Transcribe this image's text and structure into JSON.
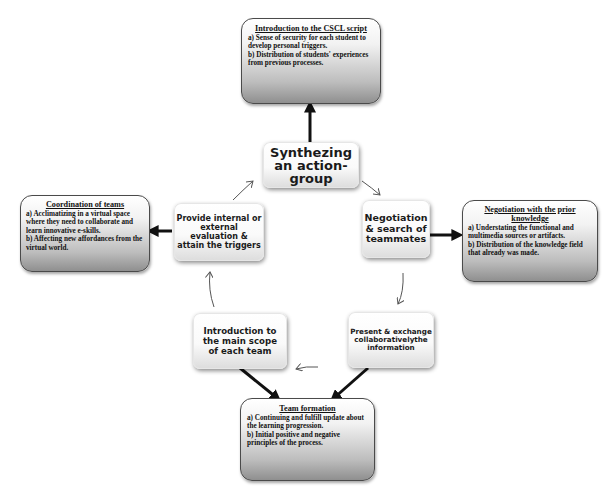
{
  "diagram": {
    "center_steps": [
      {
        "id": "synthezing",
        "label": "Synthezing an action-group"
      },
      {
        "id": "negotiation_search",
        "label": "Negotiation & search of teammates"
      },
      {
        "id": "present_exchange",
        "label": "Present & exchange collaborativelythe information"
      },
      {
        "id": "introduction_scope",
        "label": "Introduction to the main scope of each team"
      },
      {
        "id": "provide_evaluation",
        "label": "Provide internal or external evaluation & attain the triggers"
      }
    ],
    "detail_boxes": {
      "intro_cscl": {
        "title": "Introduction to the CSCL script",
        "lines": [
          "a) Sense of security for each student to develop personal triggers.",
          "b) Distribution of students' experiences from previous processes."
        ]
      },
      "negotiation_prior": {
        "title": "Negotiation with the prior knowledge",
        "lines": [
          "a) Understating the functional and multimedia sources or artifacts.",
          "b) Distribution of the knowledge field that already was made."
        ]
      },
      "team_formation": {
        "title": "Team formation",
        "lines": [
          "a) Continuing and fulfill update about the learning progression.",
          "b) Initial positive and negative principles of the process."
        ]
      },
      "coordination": {
        "title": "Coordination of teams",
        "lines": [
          "a) Acclimatizing in a virtual space where they need to collaborate and learn innovative e-skills.",
          "b) Affecting new affordances from the virtual world."
        ]
      }
    },
    "colors": {
      "thick_arrow": "#111111",
      "thin_arrow": "#555555",
      "box_border": "#4a4a4a"
    }
  }
}
